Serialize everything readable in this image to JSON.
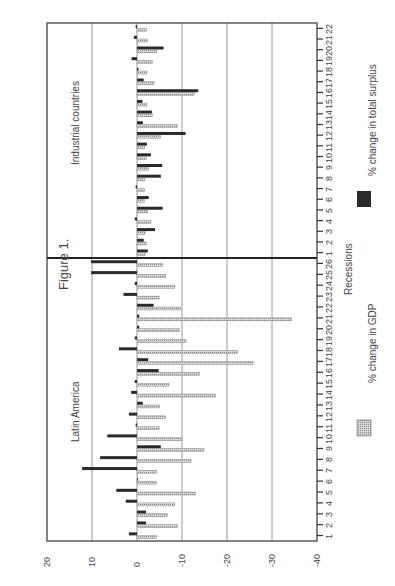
{
  "chart_data": {
    "type": "bar",
    "orientation": "rotated-90",
    "title": "Figure 1.",
    "xlabel": "Recessions",
    "ylabel": "",
    "ylim": [
      -40,
      20
    ],
    "yticks": [
      20,
      10,
      0,
      -10,
      -20,
      -30,
      -40
    ],
    "grid": true,
    "legend": [
      {
        "label": "% change in GDP",
        "pattern": "light-hatched",
        "color": "#b8b8b8"
      },
      {
        "label": "% change in total surplus",
        "pattern": "dark",
        "color": "#2a2a2a"
      }
    ],
    "panels": [
      {
        "name": "Latin America",
        "categories": [
          "1",
          "2",
          "3",
          "4",
          "5",
          "6",
          "7",
          "8",
          "9",
          "10",
          "11",
          "12",
          "13",
          "14",
          "15",
          "16",
          "17",
          "18",
          "19",
          "20",
          "21",
          "22",
          "23",
          "24",
          "25",
          "26"
        ],
        "series": [
          {
            "name": "% change in GDP",
            "values": [
              -4.3,
              -9,
              -6.7,
              -8.4,
              -13,
              -4.3,
              -4.3,
              -12,
              -14.9,
              -10,
              -4.9,
              -6.3,
              -5,
              -17.5,
              -7.1,
              -13.9,
              -25.8,
              -22.4,
              -10.9,
              -9.4,
              -34.4,
              -9.7,
              -4.9,
              -8.4,
              -6.4,
              -5.7
            ]
          },
          {
            "name": "% change in total surplus",
            "values": [
              1.8,
              -2,
              -2,
              2.5,
              4.6,
              0,
              12.2,
              8.2,
              -5.3,
              6.6,
              0.3,
              1.8,
              -1.3,
              1.3,
              0.5,
              -4.8,
              -2.5,
              4,
              0.5,
              -0.5,
              -0.5,
              -3.7,
              3,
              0.5,
              10.2,
              10.2
            ]
          }
        ]
      },
      {
        "name": "Industrial countries",
        "categories": [
          "1",
          "2",
          "3",
          "4",
          "5",
          "6",
          "7",
          "8",
          "9",
          "10",
          "11",
          "12",
          "13",
          "14",
          "15",
          "16",
          "17",
          "18",
          "19",
          "20",
          "21",
          "22"
        ],
        "series": [
          {
            "name": "% change in GDP",
            "values": [
              -1.8,
              -2.1,
              -1.8,
              -3.1,
              -2.4,
              -1.6,
              -1.7,
              -1.7,
              -2.6,
              -2.1,
              -1.7,
              -5.2,
              -9,
              -3.4,
              -2.2,
              -12.7,
              -3.8,
              -2.2,
              -3.4,
              -4.4,
              -2.3,
              -2.1
            ]
          },
          {
            "name": "% change in total surplus",
            "values": [
              -2.4,
              -1.5,
              -4,
              0.5,
              -5.7,
              -2.6,
              0.3,
              -5.3,
              -5.6,
              -3.1,
              -2.2,
              -10.8,
              -1.3,
              -3.3,
              -1.2,
              -13.6,
              -1.5,
              -0.3,
              1.2,
              -5.9,
              0.7,
              0.3
            ]
          }
        ]
      }
    ]
  }
}
